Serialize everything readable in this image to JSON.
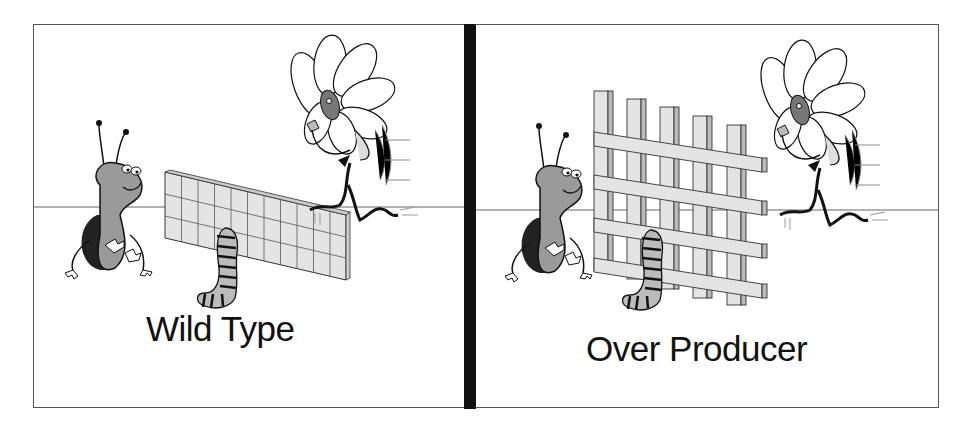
{
  "panels": [
    {
      "id": "wild-type",
      "label": "Wild Type",
      "wall": {
        "style": "low-grid",
        "columns": 11,
        "rows": 3
      },
      "characters": [
        "bug",
        "caterpillar",
        "flower-creature"
      ]
    },
    {
      "id": "over-producer",
      "label": "Over Producer",
      "wall": {
        "style": "tall-woven",
        "columns": 5,
        "rows": 4
      },
      "characters": [
        "bug",
        "caterpillar",
        "flower-creature"
      ]
    }
  ],
  "colors": {
    "frame": "#555555",
    "divider": "#111111",
    "wall_fill": "#e4e4e4",
    "bug_body": "#9a9a9a",
    "text": "#111111"
  }
}
